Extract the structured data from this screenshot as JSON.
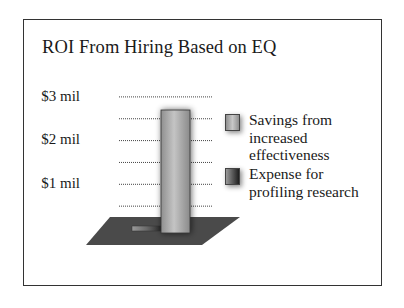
{
  "chart_data": {
    "type": "bar",
    "title": "ROI From Hiring Based on EQ",
    "xlabel": "",
    "ylabel": "",
    "categories": [
      ""
    ],
    "series": [
      {
        "name": "Savings from increased effectiveness",
        "values": [
          2.7
        ],
        "color": "#a9a9a9"
      },
      {
        "name": "Expense for profiling research",
        "values": [
          0.1
        ],
        "color": "#6e6e6e"
      }
    ],
    "ylim": [
      0,
      3
    ],
    "yticks": [
      {
        "value": 3,
        "label": "$3 mil"
      },
      {
        "value": 2.5,
        "label": ""
      },
      {
        "value": 2,
        "label": "$2 mil"
      },
      {
        "value": 1.5,
        "label": ""
      },
      {
        "value": 1,
        "label": "$1 mil"
      },
      {
        "value": 0.5,
        "label": ""
      }
    ],
    "grid": true,
    "grid_style": "dotted",
    "legend_position": "right",
    "style": "3d",
    "floor_color": "#4a4a4a"
  }
}
